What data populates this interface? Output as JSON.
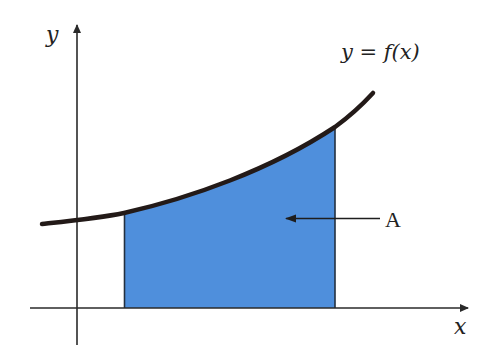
{
  "diagram": {
    "labels": {
      "y_axis": "y",
      "x_axis": "x",
      "curve": "y = f(x)",
      "area": "A"
    },
    "colors": {
      "fill": "#4f8fdc",
      "curve": "#231a18",
      "axis": "#2a2a2a"
    }
  }
}
